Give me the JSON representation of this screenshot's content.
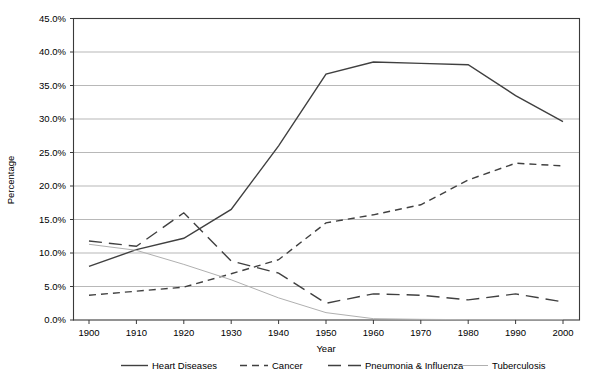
{
  "chart_data": {
    "type": "line",
    "title": "",
    "xlabel": "Year",
    "ylabel": "Percentage",
    "x": [
      1900,
      1910,
      1920,
      1930,
      1940,
      1950,
      1960,
      1970,
      1980,
      1990,
      2000
    ],
    "xticklabels": [
      "1900",
      "1910",
      "1920",
      "1930",
      "1940",
      "1950",
      "1960",
      "1970",
      "1980",
      "1990",
      "2000"
    ],
    "yticklabels": [
      "0.0%",
      "5.0%",
      "10.0%",
      "15.0%",
      "20.0%",
      "25.0%",
      "30.0%",
      "35.0%",
      "40.0%",
      "45.0%"
    ],
    "yticks": [
      0,
      5,
      10,
      15,
      20,
      25,
      30,
      35,
      40,
      45
    ],
    "ylim": [
      0,
      45
    ],
    "xlim": [
      1900,
      2000
    ],
    "grid": "horizontal",
    "legend_position": "bottom",
    "series": [
      {
        "name": "Heart Diseases",
        "style": "solid",
        "color": "#404040",
        "width": 1.4,
        "values": [
          8.0,
          10.5,
          12.2,
          16.5,
          26.0,
          36.7,
          38.5,
          38.3,
          38.1,
          33.5,
          29.6
        ]
      },
      {
        "name": "Cancer",
        "style": "dashed",
        "color": "#404040",
        "width": 1.4,
        "values": [
          3.7,
          4.3,
          4.9,
          6.9,
          9.0,
          14.5,
          15.7,
          17.2,
          20.9,
          23.4,
          23.0
        ]
      },
      {
        "name": "Pneumonia & Influenza",
        "style": "long-dash",
        "color": "#404040",
        "width": 1.4,
        "values": [
          11.8,
          11.0,
          16.0,
          8.8,
          7.0,
          2.5,
          3.9,
          3.7,
          3.0,
          3.9,
          2.7
        ]
      },
      {
        "name": "Tuberculosis",
        "style": "solid-thin",
        "color": "#b0b0b0",
        "width": 1.0,
        "values": [
          11.3,
          10.4,
          8.3,
          6.0,
          3.3,
          1.1,
          0.2,
          0.1,
          0.05,
          0.05,
          0.05
        ]
      }
    ]
  },
  "legend": {
    "items": [
      {
        "label": "Heart Diseases",
        "style": "solid"
      },
      {
        "label": "Cancer",
        "style": "dashed"
      },
      {
        "label": "Pneumonia & Influenza",
        "style": "long-dash"
      },
      {
        "label": "Tuberculosis",
        "style": "solid-thin"
      }
    ]
  }
}
